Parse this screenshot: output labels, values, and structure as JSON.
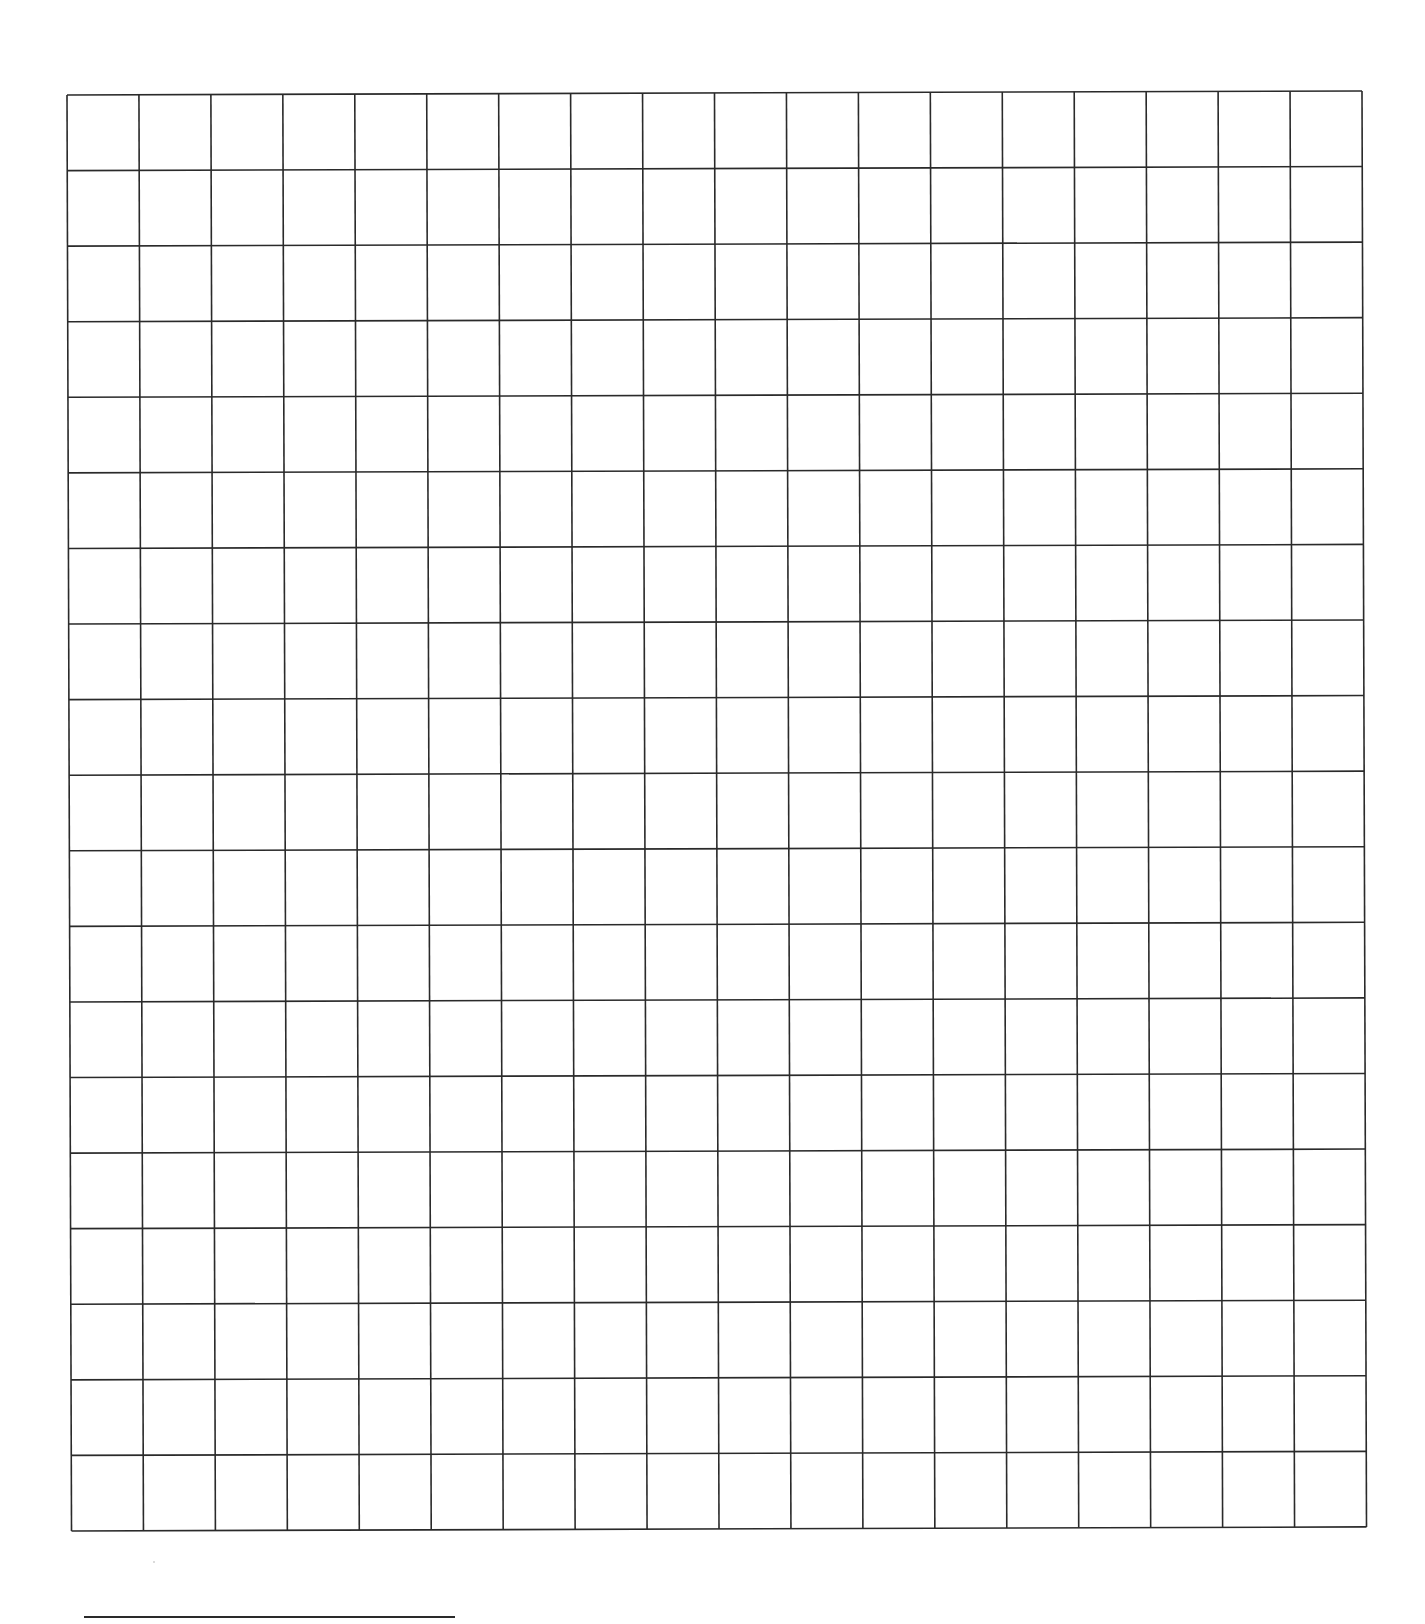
{
  "page": {
    "type": "graph-paper-worksheet",
    "background_color": "#ffffff"
  },
  "grid": {
    "columns": 18,
    "rows": 19,
    "line_color": "#2a2a2a",
    "line_width": 1.6,
    "cell_width": 71.9,
    "cell_height": 75.6,
    "approx_bounds": {
      "left": 67,
      "top": 95,
      "right": 1362,
      "bottom": 1531
    }
  },
  "footer": {
    "signature_line": {
      "left": 84,
      "right": 455,
      "y": 1616,
      "color": "#2a2a2a"
    }
  }
}
